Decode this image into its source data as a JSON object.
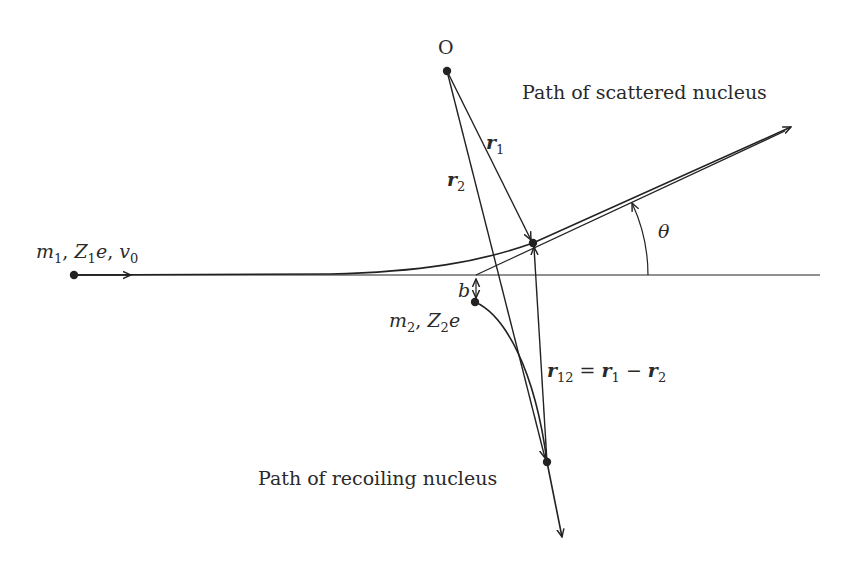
{
  "diagram": {
    "colors": {
      "stroke": "#222222",
      "text": "#2a2a2a",
      "background": "#ffffff"
    },
    "labels": {
      "origin": "O",
      "scattered_path": "Path of scattered nucleus",
      "recoiling_path": "Path of recoiling nucleus",
      "r1": {
        "base": "r",
        "sub": "1"
      },
      "r2": {
        "base": "r",
        "sub": "2"
      },
      "r12_eq": {
        "lhs_base": "r",
        "lhs_sub": "12",
        "eq": " = ",
        "a_base": "r",
        "a_sub": "1",
        "minus": " − ",
        "b_base": "r",
        "b_sub": "2"
      },
      "theta": "θ",
      "b": "b",
      "projectile": {
        "m": "m",
        "m_sub": "1",
        "sep1": ", ",
        "Z": "Z",
        "Z_sub": "1",
        "e": "e",
        "sep2": ", ",
        "v": "v",
        "v_sub": "0"
      },
      "target": {
        "m": "m",
        "m_sub": "2",
        "sep1": ", ",
        "Z": "Z",
        "Z_sub": "2",
        "e": "e"
      }
    },
    "points": {
      "O": [
        447,
        71
      ],
      "projectile_start": [
        74,
        275
      ],
      "scattered": [
        533,
        243
      ],
      "target": [
        475,
        302
      ],
      "recoil": [
        547,
        462
      ]
    }
  }
}
